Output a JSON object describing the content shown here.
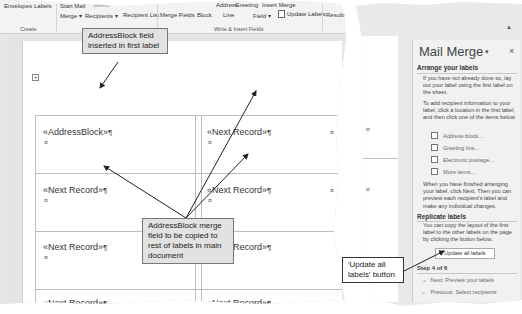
{
  "ribbon": {
    "row1": {
      "envelopes": "Envelopes",
      "labels": "Labels",
      "start_mail": "Start Mail",
      "select": "Select",
      "address": "Address",
      "greeting": "Greeting",
      "insert_merge": "Insert Merge"
    },
    "row2": {
      "merge": "Merge ▾",
      "recipients": "Recipients ▾",
      "recipient_list": "Recipient List",
      "merge_fields": "Merge Fields",
      "block": "Block",
      "line": "Line",
      "field": "Field ▾",
      "update_labels": "Update Labels",
      "results": "Results"
    },
    "groups": {
      "create": "Create",
      "write_insert": "Write & Insert Fields"
    }
  },
  "document": {
    "labels": [
      {
        "row": 1,
        "col": 1,
        "text": "«AddressBlock»"
      },
      {
        "row": 1,
        "col": 2,
        "text": "«Next Record»"
      },
      {
        "row": 2,
        "col": 1,
        "text": "«Next Record»"
      },
      {
        "row": 2,
        "col": 2,
        "text": "«Next Record»"
      },
      {
        "row": 3,
        "col": 1,
        "text": "«Next Record»"
      },
      {
        "row": 3,
        "col": 2,
        "text": "«Next Record»"
      },
      {
        "row": 4,
        "col": 1,
        "text": "«Next Record»"
      },
      {
        "row": 4,
        "col": 2,
        "text": "«Next Record»"
      }
    ],
    "pilcrow": "¶",
    "cell_mark": "¤"
  },
  "task_pane": {
    "title": "Mail Merge",
    "dropdown_glyph": "▾",
    "close_glyph": "×",
    "arrange": {
      "heading": "Arrange your labels",
      "para1": "If you have not already done so, lay out your label using the first label on the sheet.",
      "para2": "To add recipient information to your label, click a location in the first label, and then click one of the items below.",
      "items": [
        "Address block...",
        "Greeting line...",
        "Electronic postage...",
        "More items..."
      ],
      "para3": "When you have finished arranging your label, click Next. Then you can preview each recipient's label and make any individual changes."
    },
    "replicate": {
      "heading": "Replicate labels",
      "para": "You can copy the layout of the first label to the other labels on the page by clicking the button below.",
      "button": "Update all labels"
    },
    "step": "Step 4 of 6",
    "next": "Next: Preview your labels",
    "previous": "Previous: Select recipients"
  },
  "callouts": {
    "first_label": "AddressBlock field inserted in first label",
    "copied": "AddressBlock merge field to be copied to rest of labels in main document",
    "update_button": "'Update all labels' button"
  }
}
